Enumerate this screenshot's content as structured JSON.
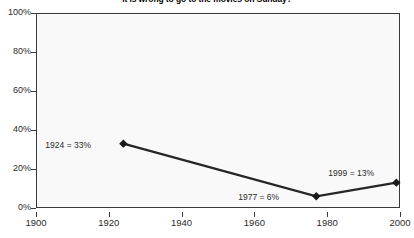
{
  "chart_data": {
    "type": "line",
    "title": "It is wrong to go to the movies on Sunday?",
    "xlabel": "",
    "ylabel": "",
    "x": [
      1924,
      1977,
      1999
    ],
    "values": [
      33,
      6,
      13
    ],
    "series": [
      {
        "name": "Percent agreeing",
        "x": [
          1924,
          1977,
          1999
        ],
        "values": [
          33,
          6,
          13
        ]
      }
    ],
    "xlim": [
      1900,
      2000
    ],
    "ylim": [
      0,
      100
    ],
    "x_ticks": [
      1900,
      1920,
      1940,
      1960,
      1980,
      2000
    ],
    "x_tick_labels": [
      "1900",
      "1920",
      "1940",
      "1960",
      "1980",
      "2000"
    ],
    "y_ticks": [
      0,
      20,
      40,
      60,
      80,
      100
    ],
    "y_tick_labels": [
      "0%",
      "20%",
      "40%",
      "60%",
      "80%",
      "100%"
    ],
    "grid": false,
    "legend": false,
    "legend_position": "none",
    "marker": "diamond",
    "line_color": "#262626",
    "marker_color": "#1a1a1a",
    "plot_background": "#f9f9f9",
    "frame_color": "#3a3a3a",
    "annotations": [
      {
        "label": "1924 = 33%",
        "x": 1924,
        "y": 33,
        "placement": "left"
      },
      {
        "label": "1977 = 6%",
        "x": 1977,
        "y": 6,
        "placement": "left"
      },
      {
        "label": "1999 = 13%",
        "x": 1999,
        "y": 13,
        "placement": "above-left"
      }
    ]
  }
}
